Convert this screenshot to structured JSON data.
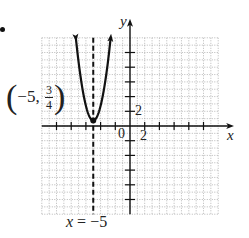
{
  "chart_data": {
    "type": "line",
    "title": "",
    "function": "y = 2(x + 5)^2 + 3/4",
    "vertex": {
      "x": -5,
      "y": 0.75,
      "label_prefix": "(−5, ",
      "label_num": "3",
      "label_den": "4",
      "label_suffix": ")"
    },
    "axis_of_symmetry": {
      "x": -5,
      "label_var": "x",
      "label_rest": " = −5",
      "style": "dashed"
    },
    "xlabel": "x",
    "ylabel": "y",
    "xlim": [
      -12,
      12
    ],
    "ylim": [
      -12,
      12
    ],
    "grid": true,
    "tick_step": 2,
    "tick_labels": {
      "origin": "0",
      "x_tick": "2",
      "y_tick": "2"
    },
    "arrows_on_curve": true
  },
  "bullet": "•"
}
